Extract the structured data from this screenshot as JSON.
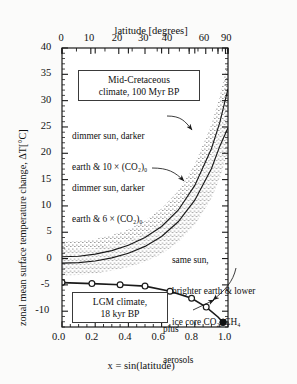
{
  "figure": {
    "background": "#fbfbfa",
    "frame_color": "#1a1a1a",
    "curve_color": "#1a1a1a",
    "stipple_color": "#3c3c3c"
  },
  "axes": {
    "x_bottom": {
      "title": "x = sin(latitude)",
      "ticks": [
        "0.0",
        "0.2",
        "0.4",
        "0.6",
        "0.8",
        "1.0"
      ],
      "tick_values": [
        0.0,
        0.2,
        0.4,
        0.6,
        0.8,
        1.0
      ],
      "lim": [
        0.0,
        1.0
      ]
    },
    "x_top": {
      "title": "latitude [degrees]",
      "ticks": [
        "0",
        "10",
        "20",
        "30",
        "40",
        "60",
        "90"
      ],
      "tick_values": [
        0,
        10,
        20,
        30,
        40,
        60,
        90
      ],
      "note": "positioned at x = sin(latitude)"
    },
    "y_left": {
      "title": "zonal mean surface temperature change, ΔT[°C]",
      "ticks": [
        "40",
        "35",
        "30",
        "25",
        "20",
        "15",
        "10",
        "5",
        "0",
        "-5",
        "-10"
      ],
      "tick_values": [
        40,
        35,
        30,
        25,
        20,
        15,
        10,
        5,
        0,
        -5,
        -10
      ],
      "lim": [
        -13,
        40
      ]
    }
  },
  "boxes": [
    {
      "id": "cretaceous",
      "line1": "Mid-Cretaceous",
      "line2": "climate, 100 Myr BP"
    },
    {
      "id": "lgm",
      "line1": "LGM climate,",
      "line2": "18 kyr BP"
    }
  ],
  "annotations": [
    {
      "id": "co2-10x",
      "line1": "dimmer sun, darker",
      "line2": "earth & 10 × (CO₂)₀"
    },
    {
      "id": "co2-6x",
      "line1": "dimmer sun, darker",
      "line2": "earth & 6 × (CO₂)₀"
    },
    {
      "id": "lgm-forcing",
      "line1": "same sun,",
      "line2": "brighter earth & lower",
      "line3": "ice core CO₂, CH₄"
    },
    {
      "id": "aerosols",
      "line1": "plus",
      "line2": "aerosols"
    }
  ],
  "chart_data": {
    "type": "line",
    "title": "",
    "xlabel": "x = sin(latitude)",
    "ylabel": "zonal mean surface temperature change, ΔT[°C]",
    "xlim": [
      0.0,
      1.0
    ],
    "ylim": [
      -13,
      40
    ],
    "grid": false,
    "legend": "none",
    "x": [
      0.0,
      0.1,
      0.2,
      0.3,
      0.4,
      0.5,
      0.6,
      0.7,
      0.8,
      0.9,
      0.95,
      1.0
    ],
    "series": [
      {
        "name": "Mid-Cretaceous, dimmer sun, darker earth & 10 × (CO2)0",
        "style": "solid line with stippled uncertainty band",
        "values": [
          4.0,
          4.1,
          4.5,
          5.2,
          6.3,
          7.9,
          10.2,
          13.6,
          18.6,
          26.0,
          31.5,
          38.5
        ],
        "band_half_width": [
          2.2,
          2.2,
          2.3,
          2.4,
          2.6,
          2.8,
          3.1,
          3.5,
          4.0,
          4.6,
          5.0,
          5.4
        ]
      },
      {
        "name": "Mid-Cretaceous, dimmer sun, darker earth & 6 × (CO2)0",
        "style": "solid line with stippled uncertainty band",
        "values": [
          2.6,
          2.7,
          3.0,
          3.6,
          4.5,
          5.8,
          7.7,
          10.5,
          14.6,
          20.6,
          25.0,
          30.5
        ],
        "band_half_width": [
          2.1,
          2.1,
          2.2,
          2.3,
          2.4,
          2.6,
          2.9,
          3.2,
          3.6,
          4.1,
          4.4,
          4.7
        ]
      },
      {
        "name": "LGM, same sun, brighter earth & lower ice core CO2, CH4",
        "style": "solid line with open circle markers",
        "marker": "open-circle",
        "x": [
          0.0,
          0.18,
          0.35,
          0.5,
          0.65,
          0.78,
          0.88
        ],
        "values": [
          -1.0,
          -1.2,
          -1.4,
          -1.6,
          -2.6,
          -3.9,
          -5.6
        ]
      },
      {
        "name": "LGM plus aerosols",
        "style": "filled circle marker",
        "marker": "filled-circle",
        "x": [
          0.97
        ],
        "values": [
          -8.6
        ]
      }
    ]
  }
}
